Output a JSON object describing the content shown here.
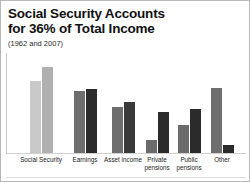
{
  "chart_data": {
    "type": "bar",
    "title": "Social Security Accounts\nfor 36% of Total Income",
    "subtitle": "(1962 and 2007)",
    "xlabel": "",
    "ylabel": "",
    "grid": false,
    "legend_position": "none",
    "ylim": [
      0,
      100
    ],
    "categories": [
      "Social Security",
      "Earnings",
      "Asset income",
      "Private\npensions",
      "Public\npensions",
      "Other"
    ],
    "series": [
      {
        "name": "1962",
        "color": "#c3c3c3",
        "values": [
          72,
          62,
          46,
          13,
          28,
          65
        ]
      },
      {
        "name": "2007",
        "color": "#3a3a3a",
        "values": [
          86,
          64,
          51,
          41,
          44,
          8
        ]
      }
    ],
    "bar_colors": {
      "social_security_first": "#c9c9c9",
      "social_security_second": "#b0b0b0",
      "earnings_first": "#6e6e6e",
      "earnings_second": "#2b2b2b",
      "asset_income_first": "#6e6e6e",
      "asset_income_second": "#3a3a3a",
      "private_pensions_first": "#6b6b6b",
      "private_pensions_second": "#2b2b2b",
      "public_pensions_first": "#6b6b6b",
      "public_pensions_second": "#2b2b2b",
      "other_first": "#6e6e6e",
      "other_second": "#2b2b2b"
    }
  }
}
